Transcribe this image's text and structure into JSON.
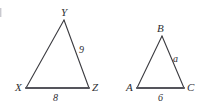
{
  "figure": {
    "stroke_color": "#3b3b40",
    "base_stroke_color": "#55555c",
    "background_color": "#ffffff",
    "label_color": "#2e2e33"
  },
  "triangles": [
    {
      "name": "triangle-xyz",
      "vertices": [
        {
          "label": "Y",
          "x": 64,
          "y": 20
        },
        {
          "label": "X",
          "x": 26,
          "y": 88
        },
        {
          "label": "Z",
          "x": 89,
          "y": 88
        }
      ],
      "vertex_labels": {
        "apex": "Y",
        "left": "X",
        "right": "Z"
      },
      "side_labels": {
        "right_side": "9",
        "base": "8"
      }
    },
    {
      "name": "triangle-abc",
      "vertices": [
        {
          "label": "B",
          "x": 162,
          "y": 36
        },
        {
          "label": "A",
          "x": 137,
          "y": 88
        },
        {
          "label": "C",
          "x": 184,
          "y": 88
        }
      ],
      "vertex_labels": {
        "apex": "B",
        "left": "A",
        "right": "C"
      },
      "side_labels": {
        "right_side": "a",
        "base": "6"
      }
    }
  ],
  "labels": {
    "y_vertex": "Y",
    "x_vertex": "X",
    "z_vertex": "Z",
    "yz_side": "9",
    "xz_base": "8",
    "b_vertex": "B",
    "a_vertex": "A",
    "c_vertex": "C",
    "bc_side": "a",
    "ac_base": "6"
  }
}
